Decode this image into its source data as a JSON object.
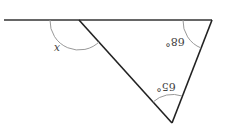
{
  "diagram": {
    "type": "geometry-triangle-exterior-angle",
    "line_color": "#222222",
    "arc_color": "#999999",
    "labels": {
      "angle_top_right": "68°",
      "angle_bottom": "65°",
      "angle_exterior": "x"
    },
    "rendered_glyphs": {
      "angle_top_right": "°89",
      "angle_bottom": "°59",
      "angle_exterior": "x"
    }
  }
}
